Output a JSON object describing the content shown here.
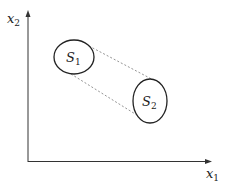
{
  "diagram": {
    "axes": {
      "x_label": "x",
      "x_label_sub": "1",
      "y_label": "x",
      "y_label_sub": "2"
    },
    "sets": [
      {
        "name": "S",
        "sub": "1"
      },
      {
        "name": "S",
        "sub": "2"
      }
    ],
    "colors": {
      "axis": "#333333",
      "ellipse": "#222222",
      "dashed": "#888888"
    }
  }
}
